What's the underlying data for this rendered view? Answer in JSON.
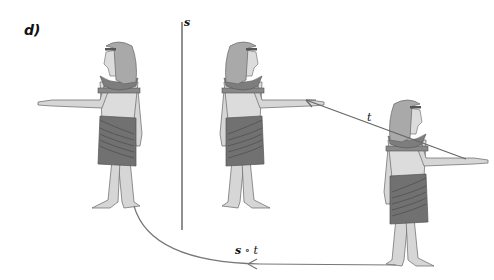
{
  "panel": {
    "label": "d)"
  },
  "mirror_line": {
    "label": "s"
  },
  "arrows": {
    "translation": {
      "label": "t"
    },
    "composition": {
      "label_symbol": "s",
      "label_op": " ∘ ",
      "label_rest": "t"
    }
  },
  "figures": [
    {
      "name": "original-figure",
      "facing": "left"
    },
    {
      "name": "reflected-figure",
      "facing": "right"
    },
    {
      "name": "translated-figure",
      "facing": "right"
    }
  ],
  "colors": {
    "skin": "#d6d6d6",
    "wig": "#a9a9a9",
    "collar": "#7d7d7d",
    "kilt": "#6f6f6f",
    "outline": "#555555",
    "line": "#777777"
  }
}
